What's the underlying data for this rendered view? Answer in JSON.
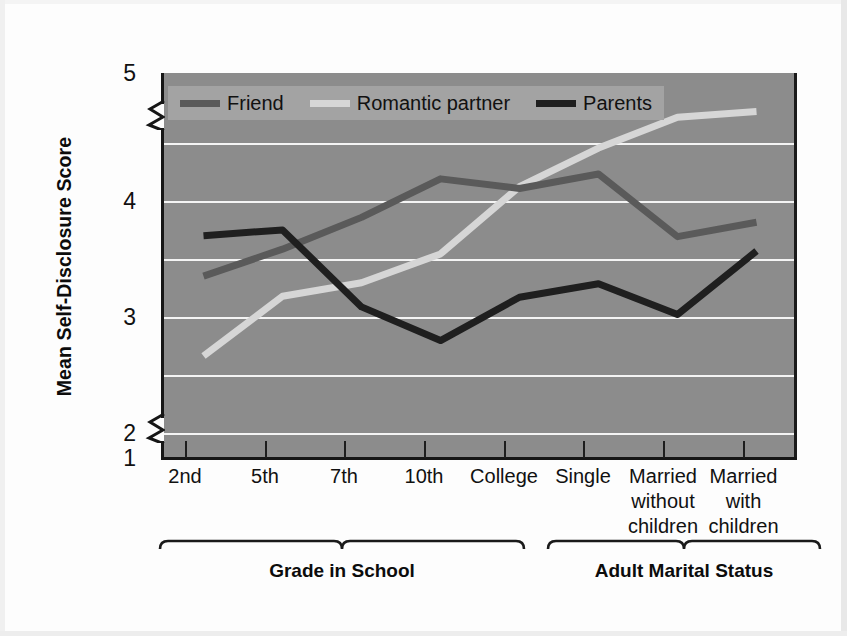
{
  "chart_data": {
    "type": "line",
    "title": "",
    "xlabel": "",
    "ylabel": "Mean Self-Disclosure Score",
    "ylim": [
      1,
      5
    ],
    "yticks": [
      1,
      2,
      3,
      4,
      5
    ],
    "gridlines": [
      2,
      2.5,
      3,
      3.5,
      4,
      4.5
    ],
    "grid": true,
    "axis_break": true,
    "legend_position": "top-left-inside",
    "categories": [
      "2nd",
      "5th",
      "7th",
      "10th",
      "College",
      "Single",
      "Married\nwithout\nchildren",
      "Married\nwith\nchildren"
    ],
    "series": [
      {
        "name": "Friend",
        "color": "#5a5a5a",
        "values": [
          2.89,
          3.17,
          3.5,
          3.9,
          3.8,
          3.95,
          3.3,
          3.45
        ]
      },
      {
        "name": "Romantic partner",
        "color": "#d6d6d6",
        "values": [
          2.06,
          2.68,
          2.82,
          3.12,
          3.82,
          4.22,
          4.54,
          4.6
        ]
      },
      {
        "name": "Parents",
        "color": "#1f1f1f",
        "values": [
          3.31,
          3.37,
          2.57,
          2.22,
          2.67,
          2.81,
          2.49,
          3.15
        ]
      }
    ],
    "group_brackets": [
      {
        "label": "Grade in School",
        "categories": [
          "2nd",
          "5th",
          "7th",
          "10th",
          "College"
        ]
      },
      {
        "label": "Adult Marital Status",
        "categories": [
          "Single",
          "Married without children",
          "Married with children"
        ]
      }
    ]
  },
  "axis": {
    "y_title": "Mean Self-Disclosure Score",
    "y_tick_labels": [
      "5",
      "4",
      "3",
      "2",
      "1"
    ],
    "x_tick_labels": [
      "2nd",
      "5th",
      "7th",
      "10th",
      "College",
      "Single",
      "Married\nwithout\nchildren",
      "Married\nwith\nchildren"
    ]
  },
  "legend": {
    "items": [
      {
        "label": "Friend",
        "color": "#5a5a5a"
      },
      {
        "label": "Romantic partner",
        "color": "#d6d6d6"
      },
      {
        "label": "Parents",
        "color": "#1f1f1f"
      }
    ]
  },
  "brackets": {
    "left_label": "Grade in School",
    "right_label": "Adult Marital Status"
  },
  "colors": {
    "plot_background": "#8c8c8c",
    "gridline": "#f4f4f4",
    "axis": "#161616",
    "page_background": "#fdfdfd",
    "legend_background": "#a3a3a3"
  }
}
